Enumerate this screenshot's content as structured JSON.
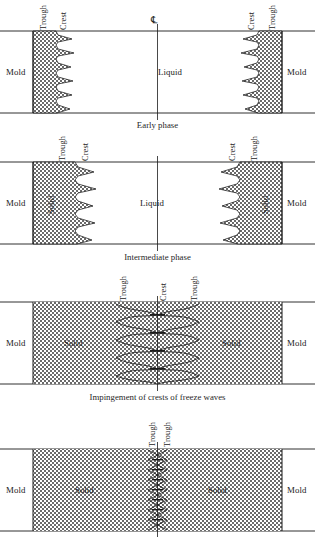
{
  "figure": {
    "centerline_symbol": "℄"
  },
  "panels": [
    {
      "id": "early-phase",
      "caption": "Early phase",
      "region_labels": {
        "left_mold": "Mold",
        "right_mold": "Mold",
        "center": "Liquid"
      },
      "callouts": {
        "left_outer": "Trough",
        "left_inner": "Crest",
        "right_inner": "Crest",
        "right_outer": "Trough"
      },
      "has_centerline_symbol": true,
      "solid_labels": []
    },
    {
      "id": "intermediate-phase",
      "caption": "Intermediate phase",
      "region_labels": {
        "left_mold": "Mold",
        "right_mold": "Mold",
        "center": "Liquid"
      },
      "callouts": {
        "left_outer": "Trough",
        "left_inner": "Crest",
        "right_inner": "Crest",
        "right_outer": "Trough"
      },
      "has_centerline_symbol": false,
      "solid_labels": [
        "Solid",
        "Solid"
      ]
    },
    {
      "id": "impingement-phase",
      "caption": "Impingement of crests of freeze waves",
      "region_labels": {
        "left_mold": "Mold",
        "right_mold": "Mold",
        "center": ""
      },
      "callouts": {
        "left_outer": "Trough",
        "center": "Crest",
        "right_outer": "Trough"
      },
      "has_centerline_symbol": false,
      "solid_labels": [
        "Solid",
        "Solid"
      ]
    },
    {
      "id": "final-phase",
      "caption": "",
      "region_labels": {
        "left_mold": "Mold",
        "right_mold": "Mold",
        "center": ""
      },
      "callouts": {
        "left_inner": "Trough",
        "right_inner": "Trough"
      },
      "has_centerline_symbol": false,
      "solid_labels": [
        "Solid",
        "Solid"
      ]
    }
  ],
  "colors": {
    "line": "#1a1a1a",
    "stipple": "#555555",
    "background": "#ffffff",
    "text": "#1f1f1f"
  }
}
